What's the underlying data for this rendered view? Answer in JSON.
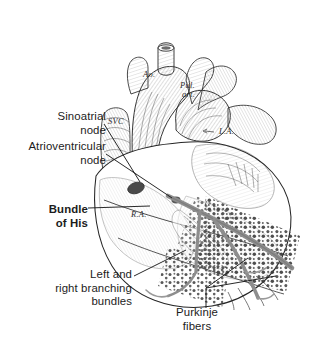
{
  "figure": {
    "background": "#ffffff",
    "ink": "#1c1c1c",
    "tract_color": "#8d8d8d",
    "node_color": "#4a4a4a"
  },
  "callouts": [
    {
      "key": "sa",
      "lines": "Sinoatrial\nnode",
      "align": "right",
      "bold": false,
      "x": 8,
      "y": 110,
      "w": 98
    },
    {
      "key": "av",
      "lines": "Atrioventricular\nnode",
      "align": "right",
      "bold": false,
      "x": 0,
      "y": 140,
      "w": 106
    },
    {
      "key": "his",
      "lines": "Bundle\nof His",
      "align": "right",
      "bold": true,
      "x": 6,
      "y": 203,
      "w": 82
    },
    {
      "key": "lrbb",
      "lines": "Left and\nright branching\nbundles",
      "align": "right",
      "bold": false,
      "x": 10,
      "y": 268,
      "w": 122
    },
    {
      "key": "purk",
      "lines": "Purkinje\nfibers",
      "align": "center",
      "bold": false,
      "x": 160,
      "y": 306,
      "w": 74
    }
  ],
  "anatomy_labels": [
    {
      "key": "ao",
      "text": "Ao.",
      "x": 143,
      "y": 77
    },
    {
      "key": "pul_art",
      "text": "Pul.",
      "x": 180,
      "y": 88
    },
    {
      "key": "pul_art2",
      "text": "art.",
      "x": 182,
      "y": 97
    },
    {
      "key": "svc",
      "text": "SVC",
      "x": 108,
      "y": 124
    },
    {
      "key": "la",
      "text": "L.A.",
      "x": 219,
      "y": 134
    },
    {
      "key": "ra",
      "text": "R.A.",
      "x": 131,
      "y": 217
    }
  ]
}
